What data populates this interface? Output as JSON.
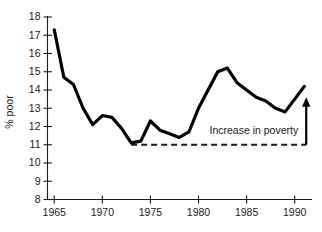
{
  "chart_data": {
    "type": "line",
    "title": "",
    "xlabel": "",
    "ylabel": "% poor",
    "xlim": [
      1964.3,
      1991.8
    ],
    "ylim": [
      8,
      18
    ],
    "grid": false,
    "legend": null,
    "x_ticks": [
      1965,
      1970,
      1975,
      1980,
      1985,
      1990
    ],
    "x_tick_labels": [
      "1965",
      "1970",
      "1975",
      "1980",
      "1985",
      "1990"
    ],
    "y_ticks": [
      8,
      9,
      10,
      11,
      12,
      13,
      14,
      15,
      16,
      17,
      18
    ],
    "y_tick_labels": [
      "8",
      "9",
      "10",
      "11",
      "12",
      "13",
      "14",
      "15",
      "16",
      "17",
      "18"
    ],
    "series": [
      {
        "name": "% poor",
        "color": "#000000",
        "x": [
          1965,
          1966,
          1967,
          1968,
          1969,
          1970,
          1971,
          1972,
          1973,
          1974,
          1975,
          1976,
          1977,
          1978,
          1979,
          1980,
          1981,
          1982,
          1983,
          1984,
          1985,
          1986,
          1987,
          1988,
          1989,
          1990,
          1991
        ],
        "values": [
          17.3,
          14.7,
          14.3,
          13.0,
          12.1,
          12.6,
          12.5,
          11.9,
          11.1,
          11.2,
          12.3,
          11.8,
          11.6,
          11.4,
          11.7,
          13.0,
          14.0,
          15.0,
          15.2,
          14.4,
          14.0,
          13.6,
          13.4,
          13.0,
          12.8,
          13.5,
          14.2
        ]
      }
    ],
    "reference_line": {
      "name": "poverty-baseline",
      "y_value": 11,
      "x_start": 1973,
      "x_end": 1991.2,
      "style": "dashed",
      "color": "#1a1a1a"
    },
    "annotations": [
      {
        "name": "increase-in-poverty",
        "text": "Increase in poverty",
        "x": 1990.6,
        "y": 11.75,
        "arrow": {
          "x": 1991.2,
          "y_from": 11.0,
          "y_to": 13.55,
          "direction": "up"
        }
      }
    ]
  }
}
